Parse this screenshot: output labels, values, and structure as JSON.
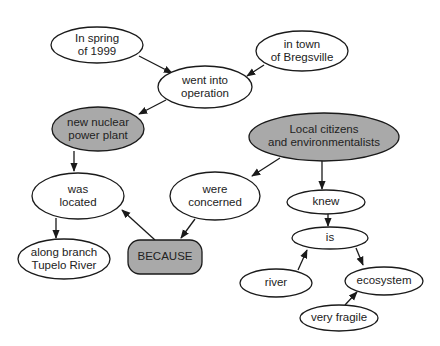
{
  "colors": {
    "plain_fill": "#ffffff",
    "highlight_fill": "#a9a9a9",
    "stroke": "#1a1a1a",
    "text": "#222222"
  },
  "nodes": {
    "spring": {
      "lines": [
        "In spring",
        "of 1999"
      ],
      "fill": "plain"
    },
    "town": {
      "lines": [
        "in town",
        "of Bregsville"
      ],
      "fill": "plain"
    },
    "operation": {
      "lines": [
        "went into",
        "operation"
      ],
      "fill": "plain"
    },
    "plant": {
      "lines": [
        "new nuclear",
        "power plant"
      ],
      "fill": "highlight"
    },
    "citizens": {
      "lines": [
        "Local citizens",
        "and environmentalists"
      ],
      "fill": "highlight"
    },
    "located": {
      "lines": [
        "was",
        "located"
      ],
      "fill": "plain"
    },
    "concerned": {
      "lines": [
        "were",
        "concerned"
      ],
      "fill": "plain"
    },
    "knew": {
      "lines": [
        "knew"
      ],
      "fill": "plain"
    },
    "river_branch": {
      "lines": [
        "along branch",
        "Tupelo River"
      ],
      "fill": "plain"
    },
    "because": {
      "lines": [
        "BECAUSE"
      ],
      "fill": "highlight",
      "shape": "rounded-rect"
    },
    "is": {
      "lines": [
        "is"
      ],
      "fill": "plain"
    },
    "river": {
      "lines": [
        "river"
      ],
      "fill": "plain"
    },
    "ecosystem": {
      "lines": [
        "ecosystem"
      ],
      "fill": "plain"
    },
    "fragile": {
      "lines": [
        "very fragile"
      ],
      "fill": "plain"
    }
  },
  "edges": [
    {
      "from": "spring",
      "to": "operation"
    },
    {
      "from": "town",
      "to": "operation"
    },
    {
      "from": "operation",
      "to": "plant"
    },
    {
      "from": "plant",
      "to": "located"
    },
    {
      "from": "located",
      "to": "river_branch"
    },
    {
      "from": "because",
      "to": "located"
    },
    {
      "from": "concerned",
      "to": "because"
    },
    {
      "from": "citizens",
      "to": "concerned"
    },
    {
      "from": "citizens",
      "to": "knew"
    },
    {
      "from": "knew",
      "to": "is"
    },
    {
      "from": "river",
      "to": "is"
    },
    {
      "from": "is",
      "to": "ecosystem"
    },
    {
      "from": "fragile",
      "to": "ecosystem"
    }
  ]
}
